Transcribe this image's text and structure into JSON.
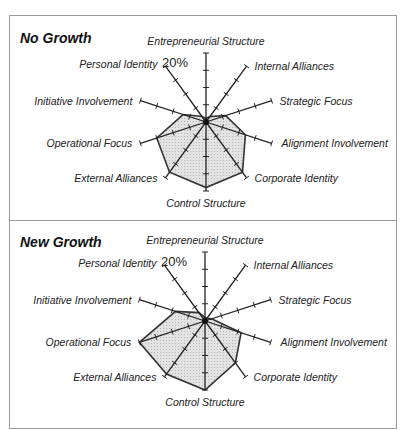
{
  "figure": {
    "top_text_cut": "Strategy Adoption Through Change",
    "scale_label": "20%"
  },
  "chart_data": [
    {
      "type": "radar",
      "title": "No Growth",
      "axis_max": 20,
      "tick_step": 5,
      "unit": "%",
      "grid": false,
      "axes": [
        "Entrepreneurial Structure",
        "Internal Alliances",
        "Strategic Focus",
        "Alignment Involvement",
        "Corporate Identity",
        "Control Structure",
        "External Alliances",
        "Operational Focus",
        "Initiative Involvement",
        "Personal Identity"
      ],
      "values": [
        1,
        2,
        6,
        12,
        18,
        19,
        18,
        15,
        7,
        2
      ],
      "fill_color": "#e3e3e3",
      "line_color": "#333333"
    },
    {
      "type": "radar",
      "title": "New Growth",
      "axis_max": 20,
      "tick_step": 5,
      "unit": "%",
      "grid": false,
      "axes": [
        "Entrepreneurial Structure",
        "Internal Alliances",
        "Strategic Focus",
        "Alignment Involvement",
        "Corporate Identity",
        "Control Structure",
        "External Alliances",
        "Operational Focus",
        "Initiative Involvement",
        "Personal Identity"
      ],
      "values": [
        1,
        1,
        2,
        11,
        15,
        20,
        19,
        20,
        9,
        3
      ],
      "fill_color": "#e3e3e3",
      "line_color": "#333333"
    }
  ]
}
